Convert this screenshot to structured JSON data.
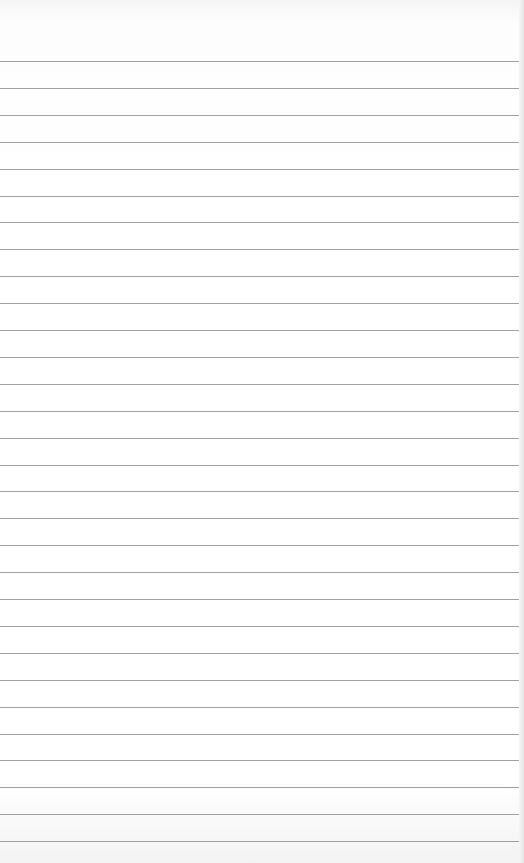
{
  "page": {
    "type": "lined-notepad-paper",
    "content": "",
    "background_color": "#ffffff",
    "rule_color": "#8f8f8f",
    "rule_count": 30,
    "first_rule_y": 61,
    "rule_spacing": 26.9
  }
}
